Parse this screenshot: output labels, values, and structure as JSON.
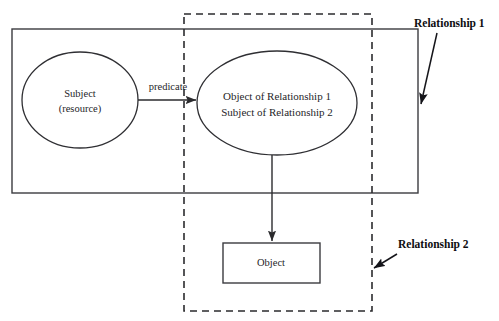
{
  "diagram": {
    "type": "rdf-reification-diagram",
    "canvas": {
      "width": 499,
      "height": 321,
      "background": "#ffffff"
    },
    "colors": {
      "stroke": "#2b2b2e",
      "ellipse_stroke": "#2f2f33",
      "box_stroke": "#3b3b3f",
      "text": "#262629",
      "annotation_text": "#0d0d10",
      "background": "#ffffff"
    },
    "containers": [
      {
        "id": "relationship-1-box",
        "style": "solid",
        "x": 12,
        "y": 29,
        "width": 406,
        "height": 164,
        "annotation_ref": "relationship-1"
      },
      {
        "id": "relationship-2-box",
        "style": "dashed",
        "x": 184,
        "y": 14,
        "width": 188,
        "height": 297,
        "annotation_ref": "relationship-2"
      }
    ],
    "nodes": [
      {
        "id": "subject-node",
        "shape": "ellipse",
        "cx": 80,
        "cy": 100,
        "rx": 58,
        "ry": 48,
        "lines": [
          "Subject",
          "(resource)"
        ]
      },
      {
        "id": "statement-node",
        "shape": "ellipse",
        "cx": 277,
        "cy": 103,
        "rx": 80,
        "ry": 52,
        "lines": [
          "Object of Relationship 1",
          "Subject of Relationship 2"
        ]
      },
      {
        "id": "object-node",
        "shape": "rect",
        "x": 223,
        "y": 243,
        "width": 97,
        "height": 40,
        "lines": [
          "Object"
        ]
      }
    ],
    "edges": [
      {
        "id": "predicate-edge",
        "from": "subject-node",
        "to": "statement-node",
        "orientation": "horizontal",
        "x1": 138,
        "y1": 100,
        "x2": 197,
        "y2": 100,
        "label": "predicate",
        "label_x": 168,
        "label_y": 90
      },
      {
        "id": "statement-to-object-edge",
        "from": "statement-node",
        "to": "object-node",
        "orientation": "vertical",
        "x1": 272,
        "y1": 155,
        "x2": 272,
        "y2": 242,
        "label": "",
        "label_x": 0,
        "label_y": 0
      }
    ],
    "annotations": [
      {
        "id": "relationship-1",
        "label": "Relationship 1",
        "label_x": 414,
        "label_y": 27,
        "x1": 437,
        "y1": 33,
        "x2": 420,
        "y2": 107
      },
      {
        "id": "relationship-2",
        "label": "Relationship 2",
        "label_x": 398,
        "label_y": 248,
        "x1": 398,
        "y1": 253,
        "x2": 372,
        "y2": 270
      }
    ]
  }
}
